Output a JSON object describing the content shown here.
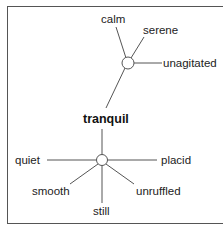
{
  "diagram": {
    "type": "word-web",
    "center_word": "tranquil",
    "groups": [
      {
        "node": "top-hub",
        "words": [
          "calm",
          "serene",
          "unagitated"
        ]
      },
      {
        "node": "bottom-hub",
        "words": [
          "quiet",
          "placid",
          "smooth",
          "unruffled",
          "still"
        ]
      }
    ],
    "colors": {
      "line": "#555555",
      "text": "#222222",
      "background": "#ffffff"
    }
  },
  "labels": {
    "calm": "calm",
    "serene": "serene",
    "unagitated": "unagitated",
    "tranquil": "tranquil",
    "quiet": "quiet",
    "placid": "placid",
    "smooth": "smooth",
    "unruffled": "unruffled",
    "still": "still"
  }
}
